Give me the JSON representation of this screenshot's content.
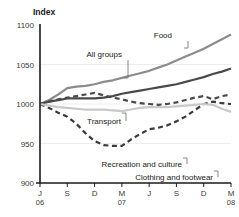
{
  "chart_data": {
    "type": "line",
    "title": "",
    "ylabel": "Index",
    "xlabel": "",
    "ylim": [
      900,
      1100
    ],
    "y_ticks": [
      1100,
      1050,
      1000,
      950,
      900
    ],
    "grid": true,
    "gridlines_at": [
      1050,
      1000,
      950
    ],
    "legend_position": "inline-annotations",
    "x_tick_labels": [
      "J",
      "S",
      "D",
      "M",
      "J",
      "S",
      "D",
      "M"
    ],
    "x_tick_years": [
      "06",
      "",
      "",
      "07",
      "",
      "",
      "",
      "08"
    ],
    "x_tick_index": [
      0,
      3,
      6,
      9,
      12,
      15,
      18,
      21
    ],
    "x": [
      "J 06",
      "J",
      "A",
      "S",
      "O",
      "N",
      "D",
      "J",
      "F",
      "M 07",
      "A",
      "M",
      "J",
      "J",
      "A",
      "S",
      "O",
      "N",
      "D",
      "J",
      "F",
      "M 08"
    ],
    "series": [
      {
        "name": "Food",
        "color": "#8c8c8c",
        "style": "solid",
        "width": 2.2,
        "values": [
          1000,
          1005,
          1012,
          1020,
          1022,
          1023,
          1025,
          1028,
          1030,
          1033,
          1036,
          1039,
          1042,
          1046,
          1050,
          1055,
          1060,
          1065,
          1070,
          1076,
          1082,
          1088
        ]
      },
      {
        "name": "All groups",
        "color": "#4a4a4a",
        "style": "solid",
        "width": 2.2,
        "values": [
          1000,
          1003,
          1005,
          1007,
          1007,
          1007,
          1007,
          1008,
          1010,
          1013,
          1015,
          1017,
          1019,
          1021,
          1023,
          1025,
          1028,
          1031,
          1034,
          1038,
          1041,
          1045
        ]
      },
      {
        "name": "Transport",
        "color": "#4a4a4a",
        "style": "dashed",
        "width": 2.2,
        "values": [
          1000,
          1003,
          1006,
          1008,
          1010,
          1012,
          1014,
          1011,
          1008,
          1006,
          1003,
          1001,
          1000,
          999,
          1000,
          1002,
          1005,
          1008,
          1010,
          1006,
          1010,
          1012
        ]
      },
      {
        "name": "Recreation and culture",
        "color": "#3a3a3a",
        "style": "dashed",
        "width": 2.2,
        "values": [
          1000,
          995,
          989,
          984,
          975,
          963,
          953,
          948,
          947,
          947,
          955,
          962,
          968,
          970,
          973,
          978,
          984,
          992,
          1000,
          1003,
          1001,
          1000
        ]
      },
      {
        "name": "Clothing and footwear",
        "color": "#c9c9c9",
        "style": "solid",
        "width": 2.2,
        "values": [
          1000,
          998,
          996,
          995,
          994,
          993,
          993,
          993,
          992,
          991,
          993,
          995,
          996,
          996,
          996,
          997,
          998,
          999,
          1000,
          999,
          994,
          990
        ]
      }
    ],
    "annotations": [
      {
        "name": "Food",
        "text": "Food",
        "x": 172,
        "y": 38,
        "align": "end",
        "leader": "M 188 41 L 188 48 L 184 48"
      },
      {
        "name": "All groups",
        "text": "All groups",
        "x": 122,
        "y": 57,
        "align": "end",
        "leader": "M 128 60 L 128 78 L 124 78"
      },
      {
        "name": "Transport",
        "text": "Transport",
        "x": 121,
        "y": 124,
        "align": "end",
        "leader": "M 126 121 L 126 113 L 122 113"
      },
      {
        "name": "Recreation and culture",
        "text": "Recreation and culture",
        "x": 182,
        "y": 167,
        "align": "end",
        "leader": "M 187 164 L 187 158 L 183 158"
      },
      {
        "name": "Clothing and footwear",
        "text": "Clothing and footwear",
        "x": 213,
        "y": 180,
        "align": "end",
        "leader": "M 218 177 L 218 171 L 214 171"
      }
    ]
  },
  "plot": {
    "left": 40,
    "right": 231,
    "top": 25,
    "bottom": 183
  }
}
